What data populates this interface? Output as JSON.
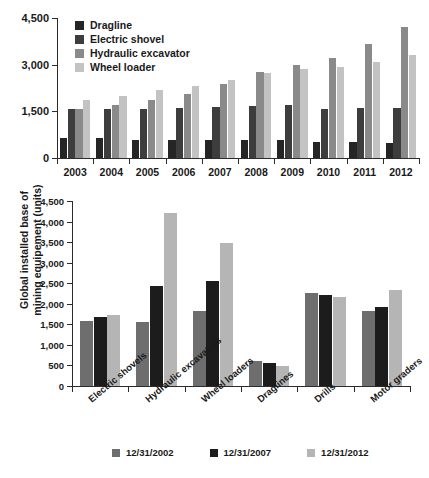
{
  "chart_data": [
    {
      "type": "bar",
      "id": "top",
      "title": "",
      "xlabel": "",
      "ylabel": "",
      "categories": [
        "2003",
        "2004",
        "2005",
        "2006",
        "2007",
        "2008",
        "2009",
        "2010",
        "2011",
        "2012"
      ],
      "ylim": [
        0,
        4500
      ],
      "yticks": [
        0,
        1500,
        3000,
        4500
      ],
      "ytick_labels": [
        "0",
        "1,500",
        "3,000",
        "4,500"
      ],
      "grid": false,
      "legend_position": "top-left",
      "series": [
        {
          "name": "Dragline",
          "color": "#252525",
          "values": [
            640,
            640,
            590,
            590,
            580,
            570,
            570,
            520,
            510,
            480
          ]
        },
        {
          "name": "Electric shovel",
          "color": "#3d3d3d",
          "values": [
            1590,
            1570,
            1590,
            1610,
            1640,
            1660,
            1700,
            1590,
            1610,
            1600
          ]
        },
        {
          "name": "Hydraulic excavator",
          "color": "#8a8a8a",
          "values": [
            1590,
            1720,
            1880,
            2060,
            2390,
            2770,
            2980,
            3230,
            3680,
            4200
          ]
        },
        {
          "name": "Wheel loader",
          "color": "#c3c3c3",
          "values": [
            1850,
            1980,
            2180,
            2320,
            2510,
            2720,
            2870,
            2920,
            3080,
            3320
          ]
        }
      ]
    },
    {
      "type": "bar",
      "id": "bottom",
      "title": "",
      "xlabel": "",
      "ylabel": "Global installed base of\nmining equipement (units)",
      "categories": [
        "Electric shovels",
        "Hydraulic excavators",
        "Wheel loaders",
        "Draglines",
        "Drills",
        "Motor graders"
      ],
      "ylim": [
        0,
        4500
      ],
      "yticks": [
        0,
        500,
        1000,
        1500,
        2000,
        2500,
        3000,
        3500,
        4000,
        4500
      ],
      "ytick_labels": [
        "0",
        "500",
        "1,000",
        "1,500",
        "2,000",
        "2,500",
        "3,000",
        "3,500",
        "4,000",
        "4,500"
      ],
      "grid": false,
      "legend_position": "bottom",
      "series": [
        {
          "name": "12/31/2002",
          "color": "#6e6e6e",
          "values": [
            1590,
            1550,
            1820,
            600,
            2270,
            1820
          ]
        },
        {
          "name": "12/31/2007",
          "color": "#1c1c1c",
          "values": [
            1680,
            2440,
            2560,
            550,
            2220,
            1930
          ]
        },
        {
          "name": "12/31/2012",
          "color": "#b5b5b5",
          "values": [
            1730,
            4200,
            3470,
            480,
            2160,
            2330
          ]
        }
      ]
    }
  ],
  "top_chart": {
    "legend": [
      {
        "label": "Dragline"
      },
      {
        "label": "Electric shovel"
      },
      {
        "label": "Hydraulic excavator"
      },
      {
        "label": "Wheel loader"
      }
    ]
  },
  "bottom_chart": {
    "y_axis_title_line1": "Global installed base of",
    "y_axis_title_line2": "mining equipement (units)",
    "legend": [
      {
        "label": "12/31/2002"
      },
      {
        "label": "12/31/2007"
      },
      {
        "label": "12/31/2012"
      }
    ]
  }
}
